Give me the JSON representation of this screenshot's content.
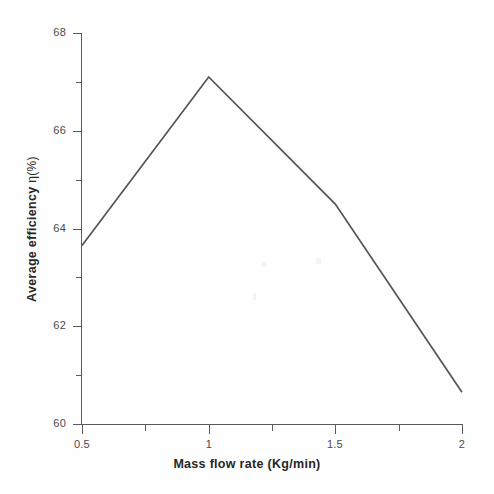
{
  "chart_data": {
    "type": "line",
    "title": "",
    "xlabel": "Mass flow rate (Kg/min)",
    "ylabel": "Average efficiency η(%)",
    "ylabel_prefix": "Average efficiency ",
    "ylabel_symbol": "η(%)",
    "x": [
      0.5,
      1,
      1.5,
      2
    ],
    "values": [
      63.65,
      67.1,
      64.5,
      60.65
    ],
    "series": [
      {
        "name": "Average efficiency",
        "values": [
          63.65,
          67.1,
          64.5,
          60.65
        ]
      }
    ],
    "xlim": [
      0.5,
      2
    ],
    "ylim": [
      60,
      68
    ],
    "grid": false,
    "legend": false,
    "line_color": "#555555",
    "axis_color": "#5a5a5a",
    "background_color": "#fefefe",
    "x_ticks": [
      {
        "value": 0.5,
        "label": "0.5",
        "major": true
      },
      {
        "value": 0.75,
        "label": "",
        "major": false
      },
      {
        "value": 1,
        "label": "1",
        "major": true
      },
      {
        "value": 1.25,
        "label": "",
        "major": false
      },
      {
        "value": 1.5,
        "label": "1.5",
        "major": true
      },
      {
        "value": 1.75,
        "label": "",
        "major": false
      },
      {
        "value": 2,
        "label": "2",
        "major": true
      }
    ],
    "y_ticks": [
      {
        "value": 68,
        "label": "68",
        "major": true
      },
      {
        "value": 67,
        "label": "",
        "major": false
      },
      {
        "value": 66,
        "label": "66",
        "major": true
      },
      {
        "value": 65,
        "label": "",
        "major": false
      },
      {
        "value": 64,
        "label": "64",
        "major": true
      },
      {
        "value": 63,
        "label": "",
        "major": false
      },
      {
        "value": 62,
        "label": "62",
        "major": true
      },
      {
        "value": 61,
        "label": "",
        "major": false
      },
      {
        "value": 60,
        "label": "60",
        "major": true
      }
    ]
  }
}
